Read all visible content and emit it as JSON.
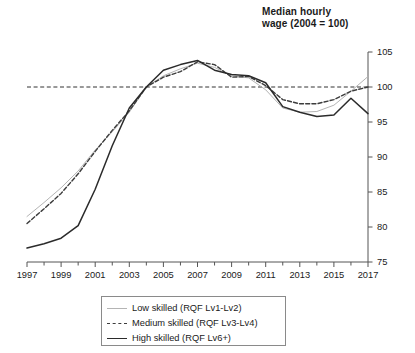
{
  "chart_data": {
    "type": "line",
    "title": "Median hourly wage (2004 = 100)",
    "title_line1": "Median hourly",
    "title_line2": "wage (2004 = 100)",
    "xlabel": "",
    "ylabel": "",
    "xlim": [
      1997,
      2017
    ],
    "ylim": [
      75,
      105
    ],
    "y_ticks": [
      75,
      80,
      85,
      90,
      95,
      100,
      105
    ],
    "y_axis_position": "right",
    "x_ticks": [
      1997,
      1999,
      2001,
      2003,
      2005,
      2007,
      2009,
      2011,
      2013,
      2015,
      2017
    ],
    "x_minor_tick_step": 1,
    "grid": false,
    "reference_line": {
      "y": 100,
      "style": "dashed",
      "color": "#333333"
    },
    "legend_position": "bottom",
    "x": [
      1997,
      1998,
      1999,
      2000,
      2001,
      2002,
      2003,
      2004,
      2005,
      2006,
      2007,
      2008,
      2009,
      2010,
      2011,
      2012,
      2013,
      2014,
      2015,
      2016,
      2017
    ],
    "series": [
      {
        "name": "Low skilled (RQF Lv1-Lv2)",
        "color": "#b4b4b4",
        "style": "solid",
        "width": 1,
        "values": [
          81.5,
          83.5,
          85.6,
          88.0,
          91.0,
          93.6,
          96.4,
          100.0,
          101.6,
          102.6,
          103.4,
          102.8,
          101.6,
          101.3,
          99.6,
          97.0,
          96.4,
          96.5,
          97.4,
          99.4,
          101.5
        ]
      },
      {
        "name": "Medium skilled (RQF Lv3-Lv4)",
        "color": "#3c3c3c",
        "style": "dashed",
        "width": 1.4,
        "values": [
          80.5,
          82.6,
          84.8,
          87.6,
          90.8,
          93.8,
          96.6,
          100.0,
          101.4,
          102.2,
          103.6,
          103.2,
          101.4,
          101.5,
          100.2,
          98.2,
          97.6,
          97.6,
          98.2,
          99.4,
          100.0
        ]
      },
      {
        "name": "High skilled (RQF Lv6+)",
        "color": "#2b2b2b",
        "style": "solid",
        "width": 1.5,
        "values": [
          77.0,
          77.6,
          78.4,
          80.2,
          85.4,
          91.6,
          97.0,
          100.0,
          102.4,
          103.2,
          103.8,
          102.4,
          101.8,
          101.6,
          100.6,
          97.2,
          96.4,
          95.8,
          96.0,
          98.4,
          96.2
        ]
      }
    ]
  },
  "legend": {
    "items": [
      {
        "label": "Low skilled (RQF Lv1-Lv2)",
        "swatch": "solid-thin-gray"
      },
      {
        "label": "Medium skilled (RQF Lv3-Lv4)",
        "swatch": "dashed-dark"
      },
      {
        "label": "High skilled (RQF Lv6+)",
        "swatch": "solid-dark"
      }
    ]
  }
}
